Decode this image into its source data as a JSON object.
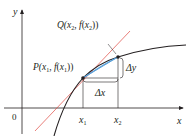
{
  "diagram": {
    "type": "secant-tangent-illustration",
    "axes": {
      "x_label": "x",
      "y_label": "y",
      "origin_label": "0"
    },
    "ticks": {
      "x1": {
        "label_main": "x",
        "label_sub": "1"
      },
      "x2": {
        "label_main": "x",
        "label_sub": "2"
      }
    },
    "points": {
      "P": {
        "name": "P",
        "label": "P(x₁, f(x₁))",
        "label_parts": [
          "P(",
          "x",
          "1",
          ", ",
          "f",
          "(",
          "x",
          "1",
          "))"
        ]
      },
      "Q": {
        "name": "Q",
        "label": "Q(x₂, f(x₂))",
        "label_parts": [
          "Q(",
          "x",
          "2",
          ", ",
          "f",
          "(",
          "x",
          "2",
          "))"
        ]
      }
    },
    "increments": {
      "dx": {
        "label": "Δx"
      },
      "dy": {
        "label": "Δy"
      }
    },
    "colors": {
      "curve": "#231f20",
      "tangent_line": "#e0443c",
      "secant_line": "#5aa0d8",
      "axes": "#231f20",
      "background": "#ffffff"
    }
  }
}
